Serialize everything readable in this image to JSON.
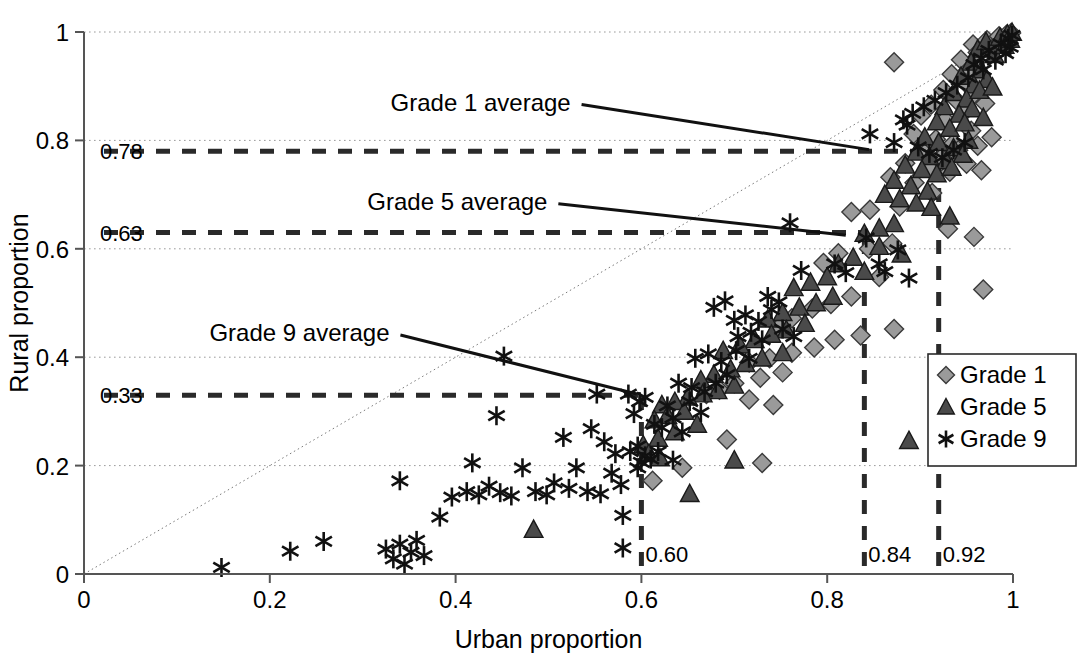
{
  "chart_data": {
    "type": "scatter",
    "title": "",
    "xlabel": "Urban proportion",
    "ylabel": "Rural proportion",
    "xlim": [
      0,
      1
    ],
    "ylim": [
      0,
      1
    ],
    "grid": true,
    "legend_position": "right-middle",
    "xticks": [
      "0",
      "0.2",
      "0.4",
      "0.6",
      "0.8",
      "1"
    ],
    "xtick_values": [
      0,
      0.2,
      0.4,
      0.6,
      0.8,
      1
    ],
    "yticks": [
      "0",
      "0.2",
      "0.4",
      "0.6",
      "0.8",
      "1"
    ],
    "ytick_values": [
      0,
      0.2,
      0.4,
      0.6,
      0.8,
      1
    ],
    "reference_line": {
      "name": "identity-line",
      "from": [
        0,
        0
      ],
      "to": [
        1,
        1
      ],
      "style": "dotted"
    },
    "annotations": [
      {
        "label": "Grade 1 average",
        "hline_value": 0.78,
        "hline_label": "0.78",
        "vline_value": 0.92,
        "vline_label": "0.92",
        "label_x": 0.33,
        "label_y": 0.855,
        "leader_to": [
          0.845,
          0.783
        ]
      },
      {
        "label": "Grade 5 average",
        "hline_value": 0.63,
        "hline_label": "0.63",
        "vline_value": 0.84,
        "vline_label": "0.84",
        "label_x": 0.305,
        "label_y": 0.672,
        "leader_to": [
          0.82,
          0.625
        ]
      },
      {
        "label": "Grade 9 average",
        "hline_value": 0.33,
        "hline_label": "0.33",
        "vline_value": 0.6,
        "vline_label": "0.60",
        "label_x": 0.135,
        "label_y": 0.43,
        "leader_to": [
          0.595,
          0.332
        ]
      }
    ],
    "series": [
      {
        "name": "Grade 1",
        "marker": "diamond",
        "color": "#9a9a9a",
        "edge_color": "#3a3a3a",
        "points": [
          [
            0.872,
            0.944
          ],
          [
            0.957,
            0.977
          ],
          [
            0.962,
            0.962
          ],
          [
            0.972,
            0.985
          ],
          [
            0.979,
            0.971
          ],
          [
            0.985,
            0.992
          ],
          [
            0.99,
            0.982
          ],
          [
            0.993,
            0.995
          ],
          [
            0.996,
            0.988
          ],
          [
            0.998,
            0.998
          ],
          [
            0.944,
            0.949
          ],
          [
            0.952,
            0.93
          ],
          [
            0.934,
            0.922
          ],
          [
            0.949,
            0.906
          ],
          [
            0.925,
            0.893
          ],
          [
            0.963,
            0.915
          ],
          [
            0.912,
            0.866
          ],
          [
            0.939,
            0.874
          ],
          [
            0.958,
            0.885
          ],
          [
            0.901,
            0.846
          ],
          [
            0.927,
            0.838
          ],
          [
            0.948,
            0.853
          ],
          [
            0.97,
            0.868
          ],
          [
            0.893,
            0.812
          ],
          [
            0.917,
            0.802
          ],
          [
            0.936,
            0.795
          ],
          [
            0.955,
            0.818
          ],
          [
            0.905,
            0.776
          ],
          [
            0.923,
            0.768
          ],
          [
            0.941,
            0.782
          ],
          [
            0.962,
            0.79
          ],
          [
            0.977,
            0.806
          ],
          [
            0.884,
            0.758
          ],
          [
            0.91,
            0.748
          ],
          [
            0.932,
            0.742
          ],
          [
            0.95,
            0.757
          ],
          [
            0.966,
            0.745
          ],
          [
            0.868,
            0.732
          ],
          [
            0.894,
            0.722
          ],
          [
            0.913,
            0.703
          ],
          [
            0.878,
            0.678
          ],
          [
            0.846,
            0.672
          ],
          [
            0.826,
            0.668
          ],
          [
            0.93,
            0.637
          ],
          [
            0.958,
            0.622
          ],
          [
            0.87,
            0.61
          ],
          [
            0.845,
            0.6
          ],
          [
            0.812,
            0.592
          ],
          [
            0.796,
            0.574
          ],
          [
            0.856,
            0.548
          ],
          [
            0.968,
            0.525
          ],
          [
            0.826,
            0.512
          ],
          [
            0.804,
            0.498
          ],
          [
            0.784,
            0.49
          ],
          [
            0.762,
            0.472
          ],
          [
            0.748,
            0.455
          ],
          [
            0.872,
            0.452
          ],
          [
            0.836,
            0.44
          ],
          [
            0.808,
            0.432
          ],
          [
            0.786,
            0.418
          ],
          [
            0.762,
            0.408
          ],
          [
            0.738,
            0.398
          ],
          [
            0.716,
            0.39
          ],
          [
            0.752,
            0.372
          ],
          [
            0.728,
            0.362
          ],
          [
            0.7,
            0.352
          ],
          [
            0.684,
            0.34
          ],
          [
            0.67,
            0.332
          ],
          [
            0.716,
            0.322
          ],
          [
            0.742,
            0.312
          ],
          [
            0.692,
            0.248
          ],
          [
            0.73,
            0.205
          ],
          [
            0.644,
            0.196
          ],
          [
            0.612,
            0.172
          ]
        ]
      },
      {
        "name": "Grade 5",
        "marker": "triangle",
        "color": "#4a4a4a",
        "edge_color": "#1a1a1a",
        "points": [
          [
            0.962,
            0.968
          ],
          [
            0.971,
            0.982
          ],
          [
            0.98,
            0.958
          ],
          [
            0.986,
            0.99
          ],
          [
            0.991,
            0.975
          ],
          [
            0.994,
            0.996
          ],
          [
            0.997,
            0.986
          ],
          [
            0.999,
            0.999
          ],
          [
            0.955,
            0.944
          ],
          [
            0.966,
            0.93
          ],
          [
            0.944,
            0.918
          ],
          [
            0.958,
            0.902
          ],
          [
            0.972,
            0.912
          ],
          [
            0.936,
            0.888
          ],
          [
            0.95,
            0.876
          ],
          [
            0.964,
            0.892
          ],
          [
            0.978,
            0.898
          ],
          [
            0.926,
            0.862
          ],
          [
            0.942,
            0.848
          ],
          [
            0.956,
            0.858
          ],
          [
            0.918,
            0.834
          ],
          [
            0.932,
            0.822
          ],
          [
            0.948,
            0.832
          ],
          [
            0.968,
            0.842
          ],
          [
            0.905,
            0.806
          ],
          [
            0.92,
            0.796
          ],
          [
            0.936,
            0.786
          ],
          [
            0.952,
            0.8
          ],
          [
            0.896,
            0.778
          ],
          [
            0.91,
            0.77
          ],
          [
            0.928,
            0.762
          ],
          [
            0.946,
            0.774
          ],
          [
            0.884,
            0.754
          ],
          [
            0.902,
            0.746
          ],
          [
            0.918,
            0.738
          ],
          [
            0.934,
            0.75
          ],
          [
            0.872,
            0.726
          ],
          [
            0.89,
            0.716
          ],
          [
            0.908,
            0.706
          ],
          [
            0.862,
            0.7
          ],
          [
            0.878,
            0.692
          ],
          [
            0.896,
            0.684
          ],
          [
            0.912,
            0.676
          ],
          [
            0.932,
            0.66
          ],
          [
            0.872,
            0.646
          ],
          [
            0.856,
            0.638
          ],
          [
            0.84,
            0.628
          ],
          [
            0.856,
            0.604
          ],
          [
            0.88,
            0.59
          ],
          [
            0.828,
            0.584
          ],
          [
            0.812,
            0.572
          ],
          [
            0.84,
            0.558
          ],
          [
            0.8,
            0.548
          ],
          [
            0.782,
            0.538
          ],
          [
            0.764,
            0.528
          ],
          [
            0.806,
            0.512
          ],
          [
            0.788,
            0.5
          ],
          [
            0.77,
            0.492
          ],
          [
            0.752,
            0.482
          ],
          [
            0.736,
            0.47
          ],
          [
            0.776,
            0.462
          ],
          [
            0.756,
            0.45
          ],
          [
            0.74,
            0.442
          ],
          [
            0.722,
            0.432
          ],
          [
            0.706,
            0.422
          ],
          [
            0.688,
            0.412
          ],
          [
            0.752,
            0.408
          ],
          [
            0.73,
            0.398
          ],
          [
            0.712,
            0.388
          ],
          [
            0.696,
            0.378
          ],
          [
            0.678,
            0.368
          ],
          [
            0.664,
            0.358
          ],
          [
            0.7,
            0.348
          ],
          [
            0.682,
            0.338
          ],
          [
            0.666,
            0.332
          ],
          [
            0.65,
            0.326
          ],
          [
            0.636,
            0.318
          ],
          [
            0.622,
            0.312
          ],
          [
            0.646,
            0.3
          ],
          [
            0.628,
            0.292
          ],
          [
            0.614,
            0.284
          ],
          [
            0.66,
            0.276
          ],
          [
            0.636,
            0.262
          ],
          [
            0.618,
            0.25
          ],
          [
            0.888,
            0.246
          ],
          [
            0.602,
            0.238
          ],
          [
            0.608,
            0.222
          ],
          [
            0.62,
            0.214
          ],
          [
            0.7,
            0.21
          ],
          [
            0.652,
            0.148
          ],
          [
            0.484,
            0.082
          ]
        ]
      },
      {
        "name": "Grade 9",
        "marker": "asterisk",
        "color": "#111111",
        "edge_color": "#111111",
        "points": [
          [
            0.148,
            0.012
          ],
          [
            0.222,
            0.042
          ],
          [
            0.258,
            0.06
          ],
          [
            0.325,
            0.046
          ],
          [
            0.333,
            0.028
          ],
          [
            0.34,
            0.055
          ],
          [
            0.345,
            0.018
          ],
          [
            0.352,
            0.04
          ],
          [
            0.358,
            0.062
          ],
          [
            0.366,
            0.034
          ],
          [
            0.34,
            0.172
          ],
          [
            0.383,
            0.105
          ],
          [
            0.396,
            0.142
          ],
          [
            0.412,
            0.152
          ],
          [
            0.425,
            0.146
          ],
          [
            0.436,
            0.162
          ],
          [
            0.448,
            0.15
          ],
          [
            0.46,
            0.144
          ],
          [
            0.452,
            0.402
          ],
          [
            0.444,
            0.292
          ],
          [
            0.418,
            0.205
          ],
          [
            0.472,
            0.196
          ],
          [
            0.486,
            0.152
          ],
          [
            0.498,
            0.146
          ],
          [
            0.506,
            0.168
          ],
          [
            0.522,
            0.158
          ],
          [
            0.516,
            0.252
          ],
          [
            0.53,
            0.196
          ],
          [
            0.542,
            0.152
          ],
          [
            0.556,
            0.148
          ],
          [
            0.546,
            0.268
          ],
          [
            0.56,
            0.244
          ],
          [
            0.572,
            0.222
          ],
          [
            0.552,
            0.332
          ],
          [
            0.568,
            0.186
          ],
          [
            0.578,
            0.165
          ],
          [
            0.58,
            0.108
          ],
          [
            0.586,
            0.332
          ],
          [
            0.592,
            0.296
          ],
          [
            0.58,
            0.048
          ],
          [
            0.604,
            0.218
          ],
          [
            0.61,
            0.212
          ],
          [
            0.618,
            0.226
          ],
          [
            0.598,
            0.318
          ],
          [
            0.604,
            0.326
          ],
          [
            0.614,
            0.276
          ],
          [
            0.622,
            0.27
          ],
          [
            0.634,
            0.288
          ],
          [
            0.644,
            0.262
          ],
          [
            0.628,
            0.31
          ],
          [
            0.652,
            0.318
          ],
          [
            0.664,
            0.298
          ],
          [
            0.64,
            0.352
          ],
          [
            0.654,
            0.344
          ],
          [
            0.668,
            0.336
          ],
          [
            0.68,
            0.352
          ],
          [
            0.692,
            0.368
          ],
          [
            0.658,
            0.398
          ],
          [
            0.672,
            0.406
          ],
          [
            0.686,
            0.392
          ],
          [
            0.702,
            0.412
          ],
          [
            0.716,
            0.398
          ],
          [
            0.704,
            0.438
          ],
          [
            0.718,
            0.446
          ],
          [
            0.73,
            0.432
          ],
          [
            0.7,
            0.468
          ],
          [
            0.712,
            0.478
          ],
          [
            0.726,
            0.466
          ],
          [
            0.74,
            0.488
          ],
          [
            0.69,
            0.504
          ],
          [
            0.678,
            0.492
          ],
          [
            0.752,
            0.452
          ],
          [
            0.764,
            0.438
          ],
          [
            0.748,
            0.502
          ],
          [
            0.736,
            0.512
          ],
          [
            0.772,
            0.56
          ],
          [
            0.76,
            0.648
          ],
          [
            0.808,
            0.572
          ],
          [
            0.82,
            0.556
          ],
          [
            0.842,
            0.62
          ],
          [
            0.856,
            0.572
          ],
          [
            0.862,
            0.558
          ],
          [
            0.876,
            0.598
          ],
          [
            0.888,
            0.546
          ],
          [
            0.846,
            0.812
          ],
          [
            0.872,
            0.796
          ],
          [
            0.886,
            0.828
          ],
          [
            0.898,
            0.788
          ],
          [
            0.91,
            0.776
          ],
          [
            0.924,
            0.768
          ],
          [
            0.936,
            0.782
          ],
          [
            0.948,
            0.796
          ],
          [
            0.958,
            0.94
          ],
          [
            0.966,
            0.952
          ],
          [
            0.974,
            0.966
          ],
          [
            0.981,
            0.948
          ],
          [
            0.987,
            0.978
          ],
          [
            0.992,
            0.96
          ],
          [
            0.995,
            0.988
          ],
          [
            0.997,
            0.972
          ],
          [
            0.999,
            0.994
          ],
          [
            0.968,
            0.93
          ],
          [
            0.952,
            0.916
          ],
          [
            0.94,
            0.902
          ],
          [
            0.928,
            0.888
          ],
          [
            0.916,
            0.874
          ],
          [
            0.904,
            0.862
          ],
          [
            0.892,
            0.85
          ],
          [
            0.882,
            0.838
          ],
          [
            0.634,
            0.21
          ],
          [
            0.6,
            0.206
          ],
          [
            0.596,
            0.196
          ],
          [
            0.588,
            0.226
          ],
          [
            0.596,
            0.236
          ]
        ]
      }
    ]
  },
  "legend": {
    "items": [
      {
        "label": "Grade 1",
        "marker": "diamond"
      },
      {
        "label": "Grade 5",
        "marker": "triangle"
      },
      {
        "label": "Grade 9",
        "marker": "asterisk"
      }
    ]
  },
  "colors": {
    "grade1": "#9a9a9a",
    "grade1_edge": "#3a3a3a",
    "grade5": "#4a4a4a",
    "grade5_edge": "#1a1a1a",
    "grade9": "#111111",
    "axis": "#555555",
    "grid": "#9a9a9a",
    "dash": "#2a2a2a"
  }
}
